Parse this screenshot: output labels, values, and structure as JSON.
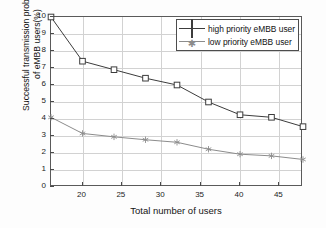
{
  "chart_data": {
    "type": "line",
    "title": "",
    "xlabel": "Total number of users",
    "ylabel": "Successful transmission probability of eMBB users(%)",
    "ylabel_line1": "Successful transmission probability",
    "ylabel_line2": "of eMBB users(%)",
    "x": [
      16,
      20,
      24,
      28,
      32,
      36,
      40,
      44,
      48
    ],
    "xlim": [
      16,
      48
    ],
    "ylim": [
      0,
      10
    ],
    "xticks": [
      20,
      25,
      30,
      35,
      40,
      45
    ],
    "yticks": [
      0,
      1,
      2,
      3,
      4,
      5,
      6,
      7,
      8,
      9,
      10
    ],
    "grid": true,
    "legend_position": "top-right",
    "series": [
      {
        "name": "high priority eMBB user",
        "marker": "square",
        "color": "#3c3c3c",
        "values": [
          10.0,
          7.4,
          6.9,
          6.4,
          6.0,
          5.0,
          4.25,
          4.1,
          3.55
        ]
      },
      {
        "name": "low priority eMBB user",
        "marker": "asterisk",
        "color": "#8c8c8c",
        "values": [
          4.1,
          3.15,
          2.95,
          2.78,
          2.63,
          2.22,
          1.93,
          1.83,
          1.62
        ]
      }
    ]
  },
  "legend": {
    "items": [
      {
        "label": "high priority eMBB user"
      },
      {
        "label": "low priority eMBB user"
      }
    ]
  },
  "axes": {
    "x_tick_labels": [
      "20",
      "25",
      "30",
      "35",
      "40",
      "45"
    ],
    "y_tick_labels": [
      "0",
      "1",
      "2",
      "3",
      "4",
      "5",
      "6",
      "7",
      "8",
      "9",
      "10"
    ]
  },
  "colors": {
    "high_priority": "#3c3c3c",
    "low_priority": "#8c8c8c",
    "grid": "#d2d2d2",
    "axis": "#5a5a5a",
    "background": "#ffffff"
  }
}
